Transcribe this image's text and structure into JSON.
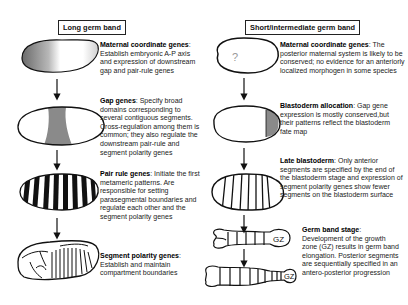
{
  "left_column": {
    "header": "Long germ band",
    "stages": [
      {
        "title": "Maternal coordinate genes",
        "desc": ": Establish embryonic A-P axis and expression of downstream gap and pair-rule genes"
      },
      {
        "title": "Gap genes",
        "desc": ": Specify broad domains corresponding to several contiguous segments. Cross-regulation among them is common; they also regulate the downstream pair-rule and segment polarity genes"
      },
      {
        "title": "Pair rule genes",
        "desc": ": Initiate the first metameric patterns. Are responsible for setting parasegmental boundaries and regulate each other and the segment polarity genes"
      },
      {
        "title": "Segment polarity genes",
        "desc": ": Establish and maintain compartment boundaries"
      }
    ]
  },
  "right_column": {
    "header": "Short/intermediate germ band",
    "stages": [
      {
        "title": "Maternal coordinate genes",
        "desc": ": The posterior maternal system is likely to be conserved; no evidence for an anteriorly localized morphogen in some species",
        "embryo_label": "?"
      },
      {
        "title": "Blastoderm allocation",
        "desc": ": Gap gene expression is mostly conserved,but their patterns reflect the blastoderm fate map"
      },
      {
        "title": "Late blastoderm",
        "desc": ": Only anterior segments are specified by the end of the blastoderm stage and expression of segment polarity genes show fewer segments on the blastoderm surface"
      },
      {
        "title": "Germ band stage",
        "desc": ": Development of the growth zone (GZ) results in germ band elongation. Posterior segments are sequentially specified in an antero-posterior progression",
        "embryo_labels": [
          "GZ",
          "GZ"
        ]
      }
    ]
  },
  "colors": {
    "shade": "#8a8a8a",
    "outline": "#111111",
    "stripe": "#111111"
  }
}
